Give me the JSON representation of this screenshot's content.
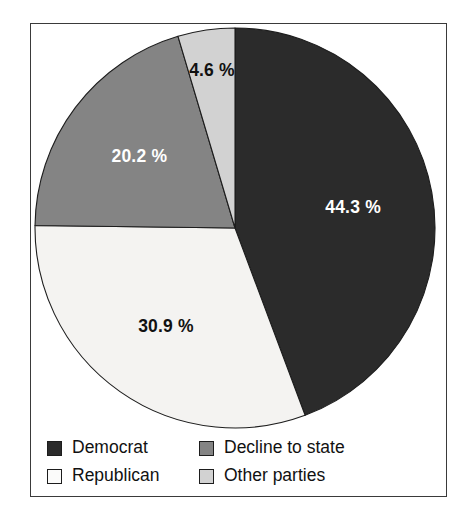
{
  "figure": {
    "background_color": "#ffffff",
    "frame_color": "#3a3a3a"
  },
  "chart_data": {
    "type": "pie",
    "title": "",
    "subtitle": "",
    "xlabel": "",
    "ylabel": "",
    "grid": false,
    "legend_position": "bottom",
    "start_angle_deg": 0,
    "direction": "clockwise",
    "categories": [
      "Democrat",
      "Republican",
      "Decline to state",
      "Other parties"
    ],
    "values": [
      44.3,
      30.9,
      20.2,
      4.6
    ],
    "value_unit": "%",
    "colors": [
      "#2b2b2b",
      "#f4f3f1",
      "#848484",
      "#d2d2d2"
    ],
    "slices": [
      {
        "label": "Democrat",
        "value": 44.3,
        "value_text": "44.3 %",
        "color": "#2b2b2b",
        "label_color": "#ffffff",
        "start_deg": 0.0,
        "end_deg": 159.48
      },
      {
        "label": "Republican",
        "value": 30.9,
        "value_text": "30.9 %",
        "color": "#f4f3f1",
        "label_color": "#111111",
        "start_deg": 159.48,
        "end_deg": 270.72
      },
      {
        "label": "Decline to state",
        "value": 20.2,
        "value_text": "20.2 %",
        "color": "#848484",
        "label_color": "#ffffff",
        "start_deg": 270.72,
        "end_deg": 343.44
      },
      {
        "label": "Other parties",
        "value": 4.6,
        "value_text": "4.6 %",
        "color": "#d2d2d2",
        "label_color": "#111111",
        "start_deg": 343.44,
        "end_deg": 360.0
      }
    ]
  },
  "labels": {
    "democrat_pct": "44.3 %",
    "republican_pct": "30.9 %",
    "decline_pct": "20.2 %",
    "other_pct": "4.6 %"
  },
  "legend": {
    "items": [
      {
        "label": "Democrat",
        "color": "#2b2b2b"
      },
      {
        "label": "Decline to state",
        "color": "#848484"
      },
      {
        "label": "Republican",
        "color": "#fbfbfa"
      },
      {
        "label": "Other parties",
        "color": "#d2d2d2"
      }
    ]
  }
}
